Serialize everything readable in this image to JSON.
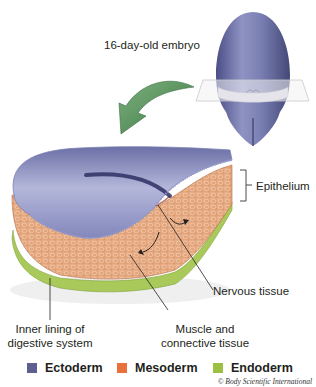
{
  "figure": {
    "labels": {
      "embryo": "16-day-old embryo",
      "epithelium": "Epithelium",
      "nervous_tissue": "Nervous tissue",
      "muscle_line1": "Muscle and",
      "muscle_line2": "connective tissue",
      "inner_line1": "Inner lining of",
      "inner_line2": "digestive system"
    },
    "legend": [
      {
        "label": "Ectoderm",
        "color": "#5d5f8f"
      },
      {
        "label": "Mesoderm",
        "color": "#e8703a"
      },
      {
        "label": "Endoderm",
        "color": "#9cbf44"
      }
    ],
    "credit": "© Body Scientific International",
    "colors": {
      "ectoderm": "#7a7fb0",
      "mesoderm": "#e3a57c",
      "endoderm": "#a9c95a",
      "arrow": "#5d9460"
    }
  }
}
